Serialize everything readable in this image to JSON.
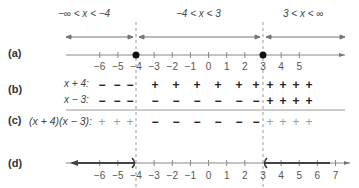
{
  "intervals": [
    {
      "label": "−∞ < x < −4",
      "x": 78
    },
    {
      "label": "−4 < x < 3",
      "x": 200
    },
    {
      "label": "3 < x < ∞",
      "x": 304
    }
  ],
  "rows": {
    "a": {
      "label": "(a)"
    },
    "b": {
      "label": "(b)",
      "factor1": "x + 4:",
      "factor2": "x − 3:"
    },
    "c": {
      "label": "(c)",
      "product": "(x + 4)(x − 3):"
    },
    "d": {
      "label": "(d)"
    }
  },
  "critical_points": [
    -4,
    3
  ],
  "ticks_a": [
    "−6",
    "−5",
    "−4",
    "−3",
    "−2",
    "−1",
    "0",
    "1",
    "2",
    "3",
    "4",
    "5"
  ],
  "ticks_d": [
    "−6",
    "−5",
    "−4",
    "−3",
    "−2",
    "−1",
    "0",
    "1",
    "2",
    "3",
    "4",
    "5",
    "6",
    "7"
  ],
  "signs": {
    "x_plus_4": {
      "left": [
        "−",
        "−",
        "−"
      ],
      "middle": [
        "+",
        "+",
        "+",
        "+",
        "+",
        "+"
      ],
      "right": [
        "+",
        "+",
        "+",
        "+"
      ]
    },
    "x_minus_3": {
      "left": [
        "−",
        "−",
        "−"
      ],
      "middle": [
        "−",
        "−",
        "−",
        "−",
        "−",
        "−"
      ],
      "right": [
        "+",
        "+",
        "+",
        "+"
      ]
    },
    "product": {
      "left": [
        "+",
        "+",
        "+"
      ],
      "middle": [
        "−",
        "−",
        "−",
        "−",
        "−",
        "−"
      ],
      "right": [
        "+",
        "+",
        "+",
        "+"
      ]
    }
  },
  "colors": {
    "line": "#888888",
    "dark_line": "#555555",
    "point": "#111111",
    "text": "#333333"
  }
}
